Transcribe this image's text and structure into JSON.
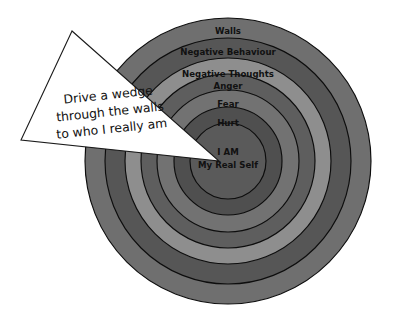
{
  "diagram": {
    "type": "concentric-circles",
    "title_visible": false,
    "background_color": "#ffffff",
    "center": {
      "x": 228,
      "y": 161
    },
    "outer_radius": 143,
    "rings": [
      {
        "id": "ring-walls",
        "label": "Walls",
        "order": 1,
        "outer_radius": 143,
        "inner_radius": 123,
        "fill": "#6f6f6f",
        "stroke": "#0d0d0d",
        "label_x": 228,
        "label_y": 31,
        "font_size": 8.6
      },
      {
        "id": "ring-negative-behaviour",
        "label": "Negative Behaviour",
        "order": 2,
        "outer_radius": 123,
        "inner_radius": 103,
        "fill": "#565656",
        "stroke": "#0d0d0d",
        "label_x": 228,
        "label_y": 52,
        "font_size": 8.6
      },
      {
        "id": "ring-negative-thoughts",
        "label": "Negative Thoughts",
        "order": 3,
        "outer_radius": 103,
        "inner_radius": 87,
        "fill": "#8e8e8e",
        "stroke": "#0d0d0d",
        "label_x": 228,
        "label_y": 74,
        "font_size": 8.6
      },
      {
        "id": "ring-anger",
        "label": "Anger",
        "order": 4,
        "outer_radius": 87,
        "inner_radius": 71,
        "fill": "#5e5e5e",
        "stroke": "#0d0d0d",
        "label_x": 228,
        "label_y": 86,
        "font_size": 8.6
      },
      {
        "id": "ring-fear",
        "label": "Fear",
        "order": 5,
        "outer_radius": 71,
        "inner_radius": 54,
        "fill": "#727272",
        "stroke": "#0d0d0d",
        "label_x": 228,
        "label_y": 104,
        "font_size": 8.6
      },
      {
        "id": "ring-hurt",
        "label": "Hurt",
        "order": 6,
        "outer_radius": 54,
        "inner_radius": 38,
        "fill": "#4f4f4f",
        "stroke": "#0d0d0d",
        "label_x": 228,
        "label_y": 123,
        "font_size": 8.6
      },
      {
        "id": "ring-core",
        "label": "I AM",
        "label_secondary": "My Real Self",
        "order": 7,
        "outer_radius": 38,
        "inner_radius": 0,
        "fill": "#5a5a5a",
        "stroke": "#0d0d0d",
        "label_x": 228,
        "label_y": 152,
        "label_secondary_x": 228,
        "label_secondary_y": 165,
        "font_size": 8.6
      }
    ],
    "wedge": {
      "id": "wedge-callout",
      "shape": "triangle",
      "points": "72,31 21,140 219,161",
      "fill": "#ffffff",
      "stroke": "#1a1a1a",
      "rotation_deg": -6,
      "text_lines": [
        "Drive a wedge",
        "through the walls",
        "to who I really am"
      ],
      "text_anchor_x": 110,
      "text_anchor_y": 112,
      "line_height": 17
    }
  }
}
